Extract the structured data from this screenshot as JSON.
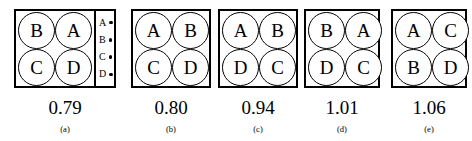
{
  "figure": {
    "type": "diagram",
    "legend": {
      "items": [
        {
          "label": "A",
          "marker": "dot-marker"
        },
        {
          "label": "B",
          "marker": "dot-marker"
        },
        {
          "label": "C",
          "marker": "dot-marker"
        },
        {
          "label": "D",
          "marker": "dot-marker"
        }
      ]
    },
    "panels": [
      {
        "caption": "(a)",
        "value": "0.79",
        "has_legend": true,
        "cells": [
          "B",
          "A",
          "C",
          "D"
        ]
      },
      {
        "caption": "(b)",
        "value": "0.80",
        "has_legend": false,
        "cells": [
          "A",
          "B",
          "C",
          "D"
        ]
      },
      {
        "caption": "(c)",
        "value": "0.94",
        "has_legend": false,
        "cells": [
          "A",
          "B",
          "D",
          "C"
        ]
      },
      {
        "caption": "(d)",
        "value": "1.01",
        "has_legend": false,
        "cells": [
          "B",
          "A",
          "D",
          "C"
        ]
      },
      {
        "caption": "(e)",
        "value": "1.06",
        "has_legend": false,
        "cells": [
          "A",
          "C",
          "B",
          "D"
        ]
      }
    ]
  },
  "colors": {
    "background": "#ffffff",
    "stroke": "#000000",
    "text": "#000000"
  }
}
